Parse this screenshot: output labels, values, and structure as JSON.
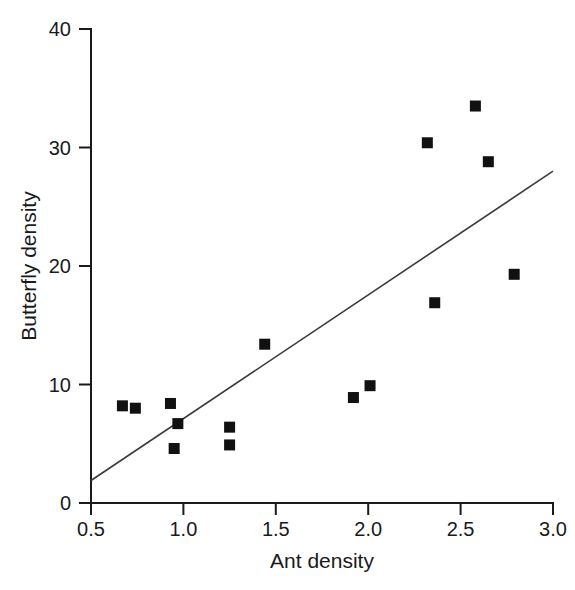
{
  "chart_data": {
    "type": "scatter",
    "title": "",
    "subtitle": "",
    "xlabel": "Ant density",
    "ylabel": "Butterfly density",
    "xlim": [
      0.5,
      3.0
    ],
    "ylim": [
      0,
      40
    ],
    "xticks": [
      "0.5",
      "1.0",
      "1.5",
      "2.0",
      "2.5",
      "3.0"
    ],
    "xtick_values": [
      0.5,
      1.0,
      1.5,
      2.0,
      2.5,
      3.0
    ],
    "yticks": [
      "0",
      "10",
      "20",
      "30",
      "40"
    ],
    "ytick_values": [
      0,
      10,
      20,
      30,
      40
    ],
    "grid": false,
    "legend": null,
    "marker": "filled-square",
    "marker_color": "#111111",
    "points": [
      {
        "x": 0.67,
        "y": 8.2
      },
      {
        "x": 0.74,
        "y": 8.0
      },
      {
        "x": 0.93,
        "y": 8.4
      },
      {
        "x": 0.97,
        "y": 6.7
      },
      {
        "x": 0.95,
        "y": 4.6
      },
      {
        "x": 1.25,
        "y": 6.4
      },
      {
        "x": 1.25,
        "y": 4.9
      },
      {
        "x": 1.44,
        "y": 13.4
      },
      {
        "x": 1.92,
        "y": 8.9
      },
      {
        "x": 2.01,
        "y": 9.9
      },
      {
        "x": 2.32,
        "y": 30.4
      },
      {
        "x": 2.36,
        "y": 16.9
      },
      {
        "x": 2.58,
        "y": 33.5
      },
      {
        "x": 2.65,
        "y": 28.8
      },
      {
        "x": 2.79,
        "y": 19.3
      }
    ],
    "trendline": {
      "type": "linear-fit",
      "x_start": 0.5,
      "y_start": 1.9,
      "x_end": 3.0,
      "y_end": 28.0,
      "slope": 10.44,
      "intercept": -3.32,
      "color": "#3a3a3a"
    }
  }
}
